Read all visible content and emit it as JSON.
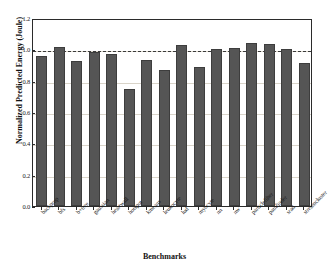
{
  "chart_data": {
    "type": "bar",
    "title": "",
    "xlabel": "Benchmarks",
    "ylabel": "Normalized Predicted Energy (Joule)",
    "ylim": [
      0.0,
      1.2
    ],
    "yticks": [
      "0.0",
      "0.2",
      "0.4",
      "0.6",
      "0.8",
      "1.0",
      "1.2"
    ],
    "ytick_values": [
      0.0,
      0.2,
      0.4,
      0.6,
      0.8,
      1.0,
      1.2
    ],
    "grid": true,
    "legend": "none",
    "reference_line": {
      "value": 1.0,
      "style": "dashed",
      "color": "#3a3a3a"
    },
    "bar_color": "#555555",
    "bar_edge_color": "#3d3d3d",
    "categories": [
      "backprop",
      "bfs",
      "b+tree",
      "gaussian",
      "heartwall",
      "hotspot",
      "kmeans",
      "leukocyte",
      "lud",
      "myocyte",
      "nn",
      "nw",
      "particlefilter",
      "pathfinder",
      "srad",
      "streamcluster"
    ],
    "values": [
      0.955,
      1.015,
      0.925,
      0.985,
      0.97,
      0.745,
      0.93,
      0.865,
      1.025,
      0.89,
      1.0,
      1.01,
      1.04,
      1.035,
      1.0,
      0.91
    ]
  }
}
